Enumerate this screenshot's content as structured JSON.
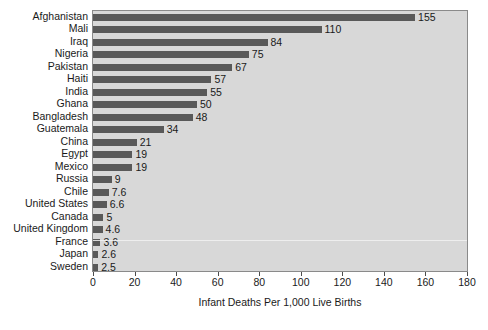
{
  "chart_data": {
    "type": "bar",
    "orientation": "horizontal",
    "title": "",
    "xlabel": "Infant Deaths Per 1,000 Live Births",
    "ylabel": "",
    "xlim": [
      0,
      180
    ],
    "xticks": [
      0,
      20,
      40,
      60,
      80,
      100,
      120,
      140,
      160,
      180
    ],
    "xtick_labels": [
      "0",
      "20",
      "40",
      "60",
      "80",
      "100",
      "120",
      "140",
      "160",
      "180"
    ],
    "grid": false,
    "legend": null,
    "bar_color": "#595959",
    "plot_background": "#d8d8d8",
    "page_background": "#ffffff",
    "value_labels_shown": true,
    "categories": [
      "Afghanistan",
      "Mali",
      "Iraq",
      "Nigeria",
      "Pakistan",
      "Haiti",
      "India",
      "Ghana",
      "Bangladesh",
      "Guatemala",
      "China",
      "Egypt",
      "Mexico",
      "Russia",
      "Chile",
      "United States",
      "Canada",
      "United Kingdom",
      "France",
      "Japan",
      "Sweden"
    ],
    "values": [
      155,
      110,
      84,
      75,
      67,
      57,
      55,
      50,
      48,
      34,
      21,
      19,
      19,
      9,
      7.6,
      6.6,
      5,
      4.6,
      3.6,
      2.6,
      2.5
    ],
    "value_labels": [
      "155",
      "110",
      "84",
      "75",
      "67",
      "57",
      "55",
      "50",
      "48",
      "34",
      "21",
      "19",
      "19",
      "9",
      "7.6",
      "6.6",
      "5",
      "4.6",
      "3.6",
      "2.6",
      "2.5"
    ]
  }
}
